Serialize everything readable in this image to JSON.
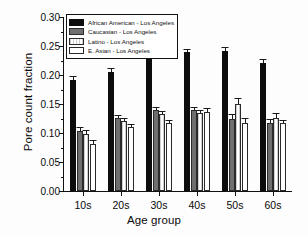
{
  "chart_data": {
    "type": "bar",
    "title": "",
    "xlabel": "Age group",
    "ylabel": "Pore count fraction",
    "categories": [
      "10s",
      "20s",
      "30s",
      "40s",
      "50s",
      "60s"
    ],
    "ylim": [
      0.0,
      0.3
    ],
    "yticks": [
      "0.00",
      "0.05",
      "0.10",
      "0.15",
      "0.20",
      "0.25",
      "0.30"
    ],
    "ytick_values": [
      0.0,
      0.05,
      0.1,
      0.15,
      0.2,
      0.25,
      0.3
    ],
    "grid": false,
    "legend_position": "upper-left-inside",
    "series": [
      {
        "name": "African American - Los Angeles",
        "color": "#0d0d0d",
        "pattern": "solid",
        "values": [
          0.191,
          0.206,
          0.228,
          0.239,
          0.241,
          0.221
        ],
        "errors": [
          0.006,
          0.005,
          0.005,
          0.004,
          0.005,
          0.005
        ]
      },
      {
        "name": "Caucasian - Los Angeles",
        "color": "#6f6f6f",
        "pattern": "dark-gray",
        "values": [
          0.104,
          0.126,
          0.139,
          0.139,
          0.125,
          0.118
        ],
        "errors": [
          0.004,
          0.004,
          0.004,
          0.004,
          0.006,
          0.004
        ]
      },
      {
        "name": "Latino - Los Angeles",
        "color": "#cfcfcf",
        "pattern": "vertical-hatch",
        "values": [
          0.098,
          0.121,
          0.132,
          0.134,
          0.15,
          0.126
        ],
        "errors": [
          0.005,
          0.004,
          0.004,
          0.004,
          0.008,
          0.007
        ]
      },
      {
        "name": "E. Asian - Los Angeles",
        "color": "#ffffff",
        "pattern": "open",
        "values": [
          0.081,
          0.11,
          0.117,
          0.136,
          0.118,
          0.117
        ],
        "errors": [
          0.005,
          0.004,
          0.004,
          0.006,
          0.007,
          0.004
        ]
      }
    ]
  }
}
